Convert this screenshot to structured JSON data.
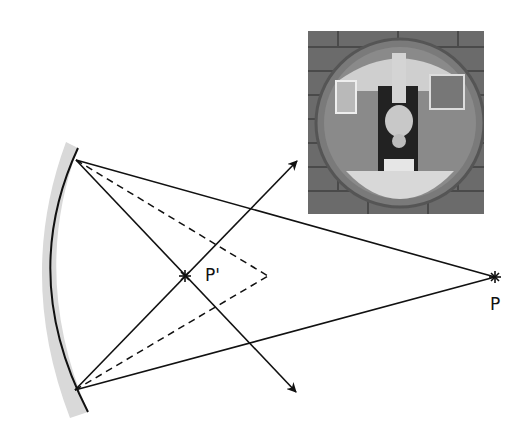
{
  "diagram": {
    "type": "convex-mirror-ray-diagram",
    "labels": {
      "object_point": "P",
      "image_point": "P'"
    },
    "points": {
      "P": [
        495,
        277
      ],
      "P_prime": [
        185,
        276
      ],
      "dashed_apex": [
        268,
        276
      ],
      "upper_reflection": [
        76,
        160
      ],
      "lower_reflection": [
        75,
        390
      ],
      "upper_arrow_tip": [
        297,
        161
      ],
      "lower_arrow_tip": [
        296,
        392
      ]
    },
    "mirror": {
      "surface_color": "#111111",
      "backing_color": "#d9d9d9"
    },
    "photo": {
      "description": "Photograph of a round convex mirror mounted on a brick wall, showing an inverted reflection of a person in a doorway"
    },
    "colors": {
      "line": "#111111",
      "background": "#ffffff"
    }
  }
}
